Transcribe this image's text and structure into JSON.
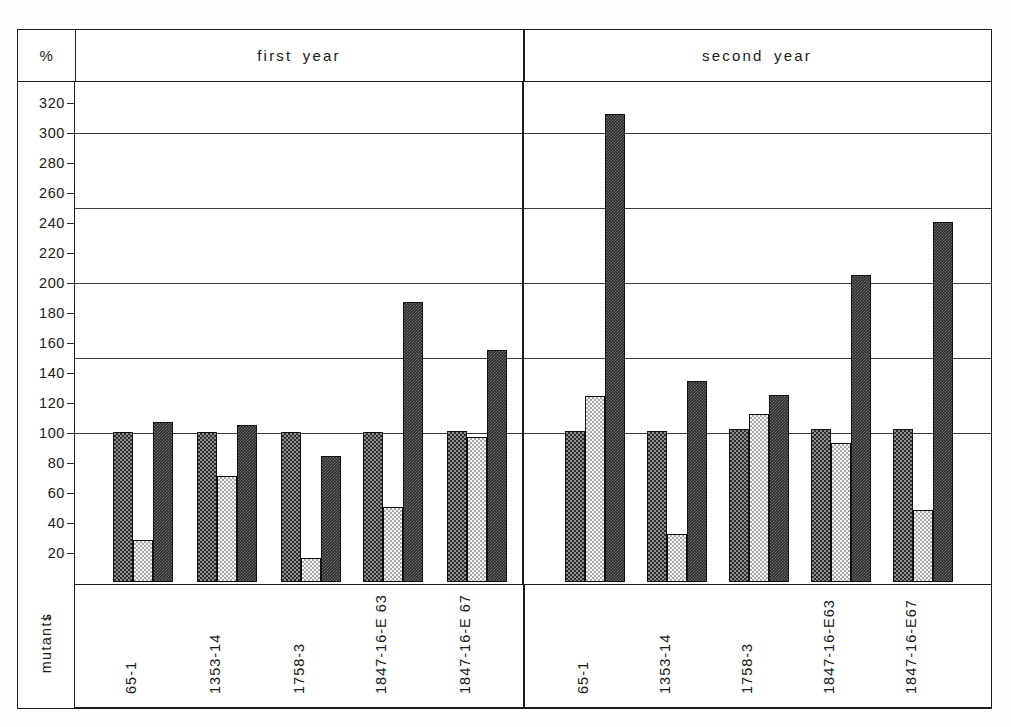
{
  "header": {
    "unit_label": "%",
    "group_year_1": "first  year",
    "group_year_2": "second  year"
  },
  "axis": {
    "category_axis_label": "mutants",
    "arrow_glyph": "→",
    "yticks": [
      20,
      40,
      60,
      80,
      100,
      120,
      140,
      160,
      180,
      200,
      220,
      240,
      260,
      280,
      300,
      320
    ],
    "gridline_values": [
      100,
      150,
      200,
      250,
      300
    ]
  },
  "chart_data": {
    "type": "bar",
    "title": "",
    "xlabel": "mutants",
    "ylabel": "%",
    "ylim": [
      0,
      335
    ],
    "ytick_step": 20,
    "grid": true,
    "gridlines_at": [
      100,
      150,
      200,
      250,
      300
    ],
    "legend_position": "none",
    "panels": [
      {
        "name": "first  year",
        "categories": [
          "65-1",
          "1353-14",
          "1758-3",
          "1847-16-E 63",
          "1847-16-E 67"
        ],
        "series": [
          {
            "name": "series-1",
            "pattern": "dark-checker",
            "values": [
              100,
              100,
              100,
              100,
              101
            ]
          },
          {
            "name": "series-2",
            "pattern": "light-dot",
            "values": [
              28,
              71,
              16,
              50,
              97
            ]
          },
          {
            "name": "series-3",
            "pattern": "dense-dark",
            "values": [
              107,
              105,
              84,
              187,
              155
            ]
          }
        ]
      },
      {
        "name": "second  year",
        "categories": [
          "65-1",
          "1353-14",
          "1758-3",
          "1847-16-E63",
          "1847-16-E67"
        ],
        "series": [
          {
            "name": "series-1",
            "pattern": "dark-checker",
            "values": [
              101,
              101,
              102,
              102,
              102
            ]
          },
          {
            "name": "series-2",
            "pattern": "light-dot",
            "values": [
              124,
              32,
              112,
              93,
              48
            ]
          },
          {
            "name": "series-3",
            "pattern": "dense-dark",
            "values": [
              312,
              134,
              125,
              205,
              240
            ]
          }
        ]
      }
    ]
  }
}
